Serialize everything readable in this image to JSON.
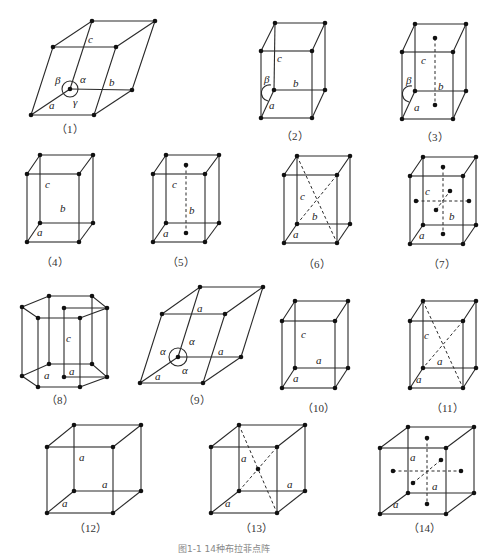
{
  "figure": {
    "caption": "图1-1  14种布拉菲点阵",
    "colors": {
      "line": "#2a2a2a",
      "point": "#111111",
      "background": "#ffffff"
    }
  },
  "lattices": [
    {
      "id": 1,
      "caption": "（1）",
      "labels": {
        "a": "a",
        "b": "b",
        "c": "c",
        "alpha": "α",
        "beta": "β",
        "gamma": "γ"
      }
    },
    {
      "id": 2,
      "caption": "（2）",
      "labels": {
        "a": "a",
        "b": "b",
        "c": "c",
        "beta": "β"
      }
    },
    {
      "id": 3,
      "caption": "（3）",
      "labels": {
        "a": "a",
        "b": "b",
        "c": "c",
        "beta": "β"
      }
    },
    {
      "id": 4,
      "caption": "（4）",
      "labels": {
        "a": "a",
        "b": "b",
        "c": "c"
      }
    },
    {
      "id": 5,
      "caption": "（5）",
      "labels": {
        "a": "a",
        "b": "b",
        "c": "c"
      }
    },
    {
      "id": 6,
      "caption": "（6）",
      "labels": {
        "a": "a",
        "b": "b",
        "c": "c"
      }
    },
    {
      "id": 7,
      "caption": "（7）",
      "labels": {
        "a": "a",
        "b": "b",
        "c": "c"
      }
    },
    {
      "id": 8,
      "caption": "（8）",
      "labels": {
        "a1": "a",
        "a2": "a",
        "c": "c"
      }
    },
    {
      "id": 9,
      "caption": "（9）",
      "labels": {
        "a1": "a",
        "a2": "a",
        "a3": "a",
        "alpha1": "α",
        "alpha2": "α",
        "alpha3": "α"
      }
    },
    {
      "id": 10,
      "caption": "（10）",
      "labels": {
        "a1": "a",
        "a2": "a",
        "c": "c"
      }
    },
    {
      "id": 11,
      "caption": "（11）",
      "labels": {
        "a1": "a",
        "a2": "a",
        "c": "c"
      }
    },
    {
      "id": 12,
      "caption": "（12）",
      "labels": {
        "a1": "a",
        "a2": "a",
        "a3": "a"
      }
    },
    {
      "id": 13,
      "caption": "（13）",
      "labels": {
        "a1": "a",
        "a2": "a",
        "a3": "a"
      }
    },
    {
      "id": 14,
      "caption": "（14）",
      "labels": {
        "a1": "a",
        "a2": "a",
        "a3": "a"
      }
    }
  ]
}
